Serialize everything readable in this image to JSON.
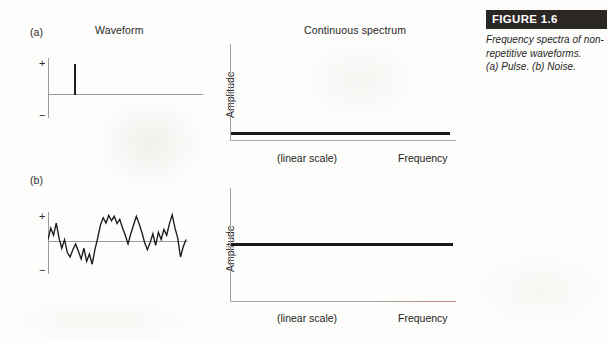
{
  "figure": {
    "banner_label": "FIGURE 1.6",
    "caption_lines": [
      "Frequency spectra of non-",
      "repetitive waveforms.",
      "(a) Pulse. (b) Noise."
    ],
    "banner_bg": "#2b2725",
    "banner_text_color": "#ffffff"
  },
  "columns": {
    "waveform_title": "Waveform",
    "spectrum_title": "Continuous spectrum"
  },
  "panels": [
    {
      "label": "(a)",
      "waveform": {
        "plus_sign": "+",
        "minus_sign": "−",
        "kind": "pulse"
      },
      "spectrum": {
        "ylabel": "Amplitude",
        "xlabel_scale": "(linear scale)",
        "xlabel": "Frequency",
        "line_level_fraction": 0.93
      }
    },
    {
      "label": "(b)",
      "waveform": {
        "plus_sign": "+",
        "minus_sign": "−",
        "kind": "noise"
      },
      "spectrum": {
        "ylabel": "Amplitude",
        "xlabel_scale": "(linear scale)",
        "xlabel": "Frequency",
        "line_level_fraction": 0.5
      }
    }
  ],
  "chart_data": {
    "type": "line",
    "title": "Frequency spectra of non-repetitive waveforms",
    "subplots": [
      {
        "name": "(a) Pulse waveform",
        "type": "line",
        "xlabel": "Time",
        "ylabel": "Amplitude",
        "yticks": [
          "+",
          "−"
        ],
        "description": "Single narrow positive-going impulse on a flat zero baseline",
        "x": [
          0,
          0.17,
          0.185,
          0.2,
          0.215,
          1.0
        ],
        "y": [
          0,
          0,
          0.95,
          0.95,
          0,
          0
        ]
      },
      {
        "name": "(a) Continuous spectrum of pulse",
        "type": "line",
        "xlabel": "Frequency",
        "xlabel_note": "(linear scale)",
        "ylabel": "Amplitude",
        "grid": false,
        "description": "Flat continuous spectrum at a low constant amplitude across all frequencies",
        "x": [
          0,
          1
        ],
        "y": [
          0.07,
          0.07
        ],
        "ylim": [
          0,
          1
        ],
        "xlim": [
          0,
          1
        ]
      },
      {
        "name": "(b) Noise waveform",
        "type": "line",
        "xlabel": "Time",
        "ylabel": "Amplitude",
        "yticks": [
          "+",
          "−"
        ],
        "description": "Random jagged noise fluctuating about zero between + and − limits",
        "x": [
          0.0,
          0.02,
          0.04,
          0.06,
          0.08,
          0.1,
          0.12,
          0.14,
          0.16,
          0.18,
          0.2,
          0.22,
          0.24,
          0.26,
          0.28,
          0.3,
          0.32,
          0.34,
          0.36,
          0.38,
          0.4,
          0.42,
          0.44,
          0.46,
          0.48,
          0.5,
          0.52,
          0.54,
          0.56,
          0.58,
          0.6,
          0.62,
          0.64,
          0.66,
          0.68,
          0.7,
          0.72,
          0.74,
          0.76,
          0.78,
          0.8,
          0.82,
          0.84,
          0.86,
          0.88,
          0.9,
          0.92,
          0.94,
          0.96,
          0.98,
          1.0
        ],
        "y": [
          0.05,
          0.45,
          0.2,
          0.62,
          0.1,
          -0.25,
          0.05,
          -0.4,
          -0.55,
          -0.3,
          -0.1,
          -0.35,
          -0.62,
          -0.25,
          -0.7,
          -0.45,
          -0.8,
          -0.3,
          0.1,
          0.55,
          0.8,
          0.62,
          0.88,
          0.7,
          0.85,
          0.6,
          0.75,
          0.45,
          0.2,
          -0.1,
          0.25,
          0.55,
          0.85,
          0.6,
          0.3,
          -0.05,
          -0.3,
          -0.05,
          0.25,
          -0.15,
          0.3,
          0.05,
          0.4,
          0.2,
          0.6,
          0.9,
          0.45,
          0.1,
          -0.55,
          -0.2,
          0.05
        ],
        "ylim": [
          -1,
          1
        ]
      },
      {
        "name": "(b) Continuous spectrum of noise",
        "type": "line",
        "xlabel": "Frequency",
        "xlabel_note": "(linear scale)",
        "ylabel": "Amplitude",
        "grid": false,
        "description": "Flat continuous spectrum at a mid-level constant amplitude across all frequencies",
        "x": [
          0,
          1
        ],
        "y": [
          0.5,
          0.5
        ],
        "ylim": [
          0,
          1
        ],
        "xlim": [
          0,
          1
        ]
      }
    ]
  }
}
